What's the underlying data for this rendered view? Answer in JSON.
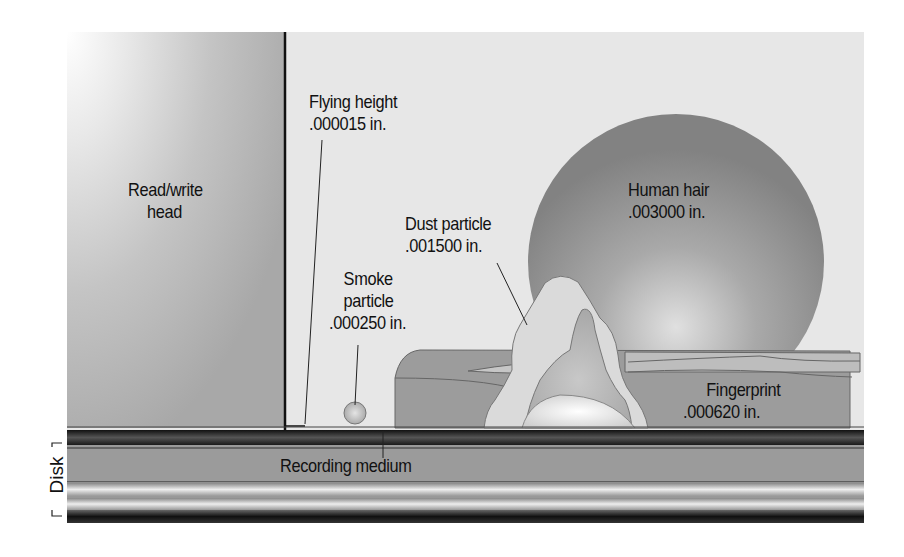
{
  "diagram": {
    "colors": {
      "background_panel": "#e6e6e6",
      "head": "#b8b8b8",
      "hair_sphere": "#8a8a8a",
      "fingerprint": "#9e9e9e",
      "dust": "#d9d9d9",
      "disk_dark": "#2a2a2a",
      "disk_medium": "#8f8f8f",
      "label_text": "#111111"
    },
    "labels": {
      "head": {
        "line1": "Read/write",
        "line2": "head"
      },
      "flying_height": {
        "line1": "Flying height",
        "line2": ".000015 in."
      },
      "smoke": {
        "line1": "Smoke",
        "line2": "particle",
        "line3": ".000250 in."
      },
      "dust": {
        "line1": "Dust particle",
        "line2": ".001500 in."
      },
      "hair": {
        "line1": "Human hair",
        "line2": ".003000 in."
      },
      "fingerprint": {
        "line1": "Fingerprint",
        "line2": ".000620 in."
      },
      "recording_medium": "Recording medium",
      "disk": "Disk"
    },
    "items": [
      {
        "name": "Flying height",
        "size_in": 1.5e-05
      },
      {
        "name": "Smoke particle",
        "size_in": 0.00025
      },
      {
        "name": "Fingerprint",
        "size_in": 0.00062
      },
      {
        "name": "Dust particle",
        "size_in": 0.0015
      },
      {
        "name": "Human hair",
        "size_in": 0.003
      }
    ]
  }
}
